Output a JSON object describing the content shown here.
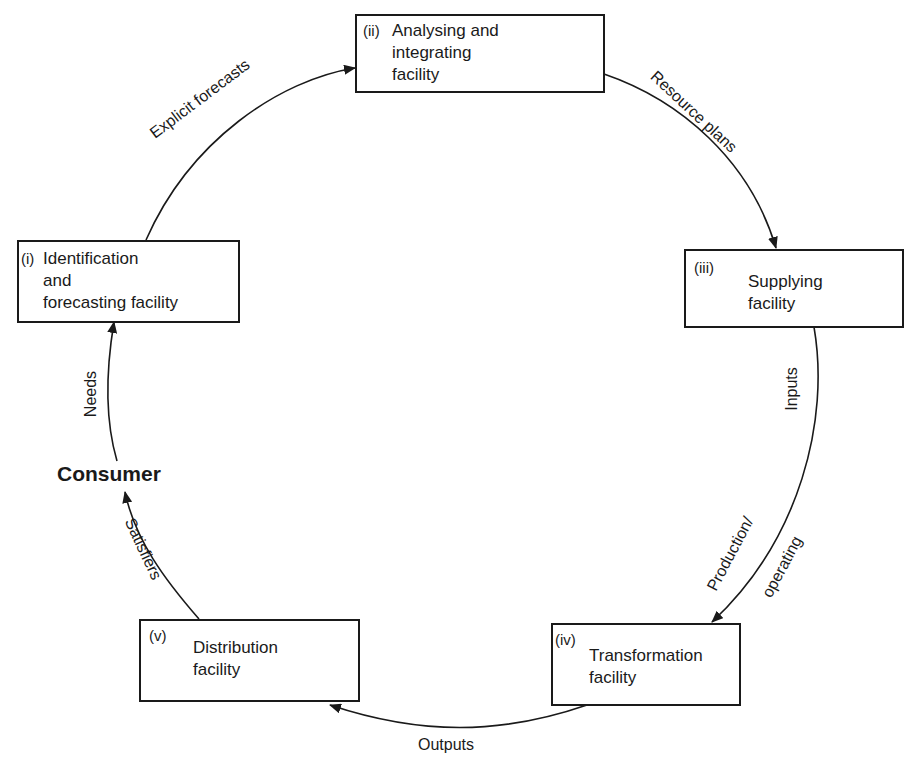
{
  "diagram": {
    "type": "cycle",
    "center_label": "Consumer",
    "nodes": [
      {
        "id": "i",
        "number": "(i)",
        "label": "Identification\nand\nforecasting facility"
      },
      {
        "id": "ii",
        "number": "(ii)",
        "label": "Analysing and\nintegrating\nfacility"
      },
      {
        "id": "iii",
        "number": "(iii)",
        "label": "Supplying\nfacility"
      },
      {
        "id": "iv",
        "number": "(iv)",
        "label": "Transformation\nfacility"
      },
      {
        "id": "v",
        "number": "(v)",
        "label": "Distribution\nfacility"
      }
    ],
    "flows": [
      {
        "from": "Consumer",
        "to": "i",
        "label": "Needs"
      },
      {
        "from": "i",
        "to": "ii",
        "label": "Explicit forecasts"
      },
      {
        "from": "ii",
        "to": "iii",
        "label": "Resource plans"
      },
      {
        "from": "iii",
        "to": "iv",
        "label": "Inputs"
      },
      {
        "from": "iii",
        "to": "iv",
        "label": "Production/",
        "label2": "operating"
      },
      {
        "from": "iv",
        "to": "v",
        "label": "Outputs"
      },
      {
        "from": "v",
        "to": "Consumer",
        "label": "Satisfiers"
      }
    ]
  }
}
